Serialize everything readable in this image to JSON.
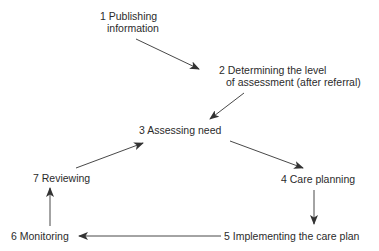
{
  "diagram": {
    "type": "cycle-flow",
    "nodes": [
      {
        "id": 1,
        "number": "1",
        "line1": "1 Publishing",
        "line2": "information"
      },
      {
        "id": 2,
        "number": "2",
        "line1": "2 Determining the level",
        "line2": "of assessment (after referral)"
      },
      {
        "id": 3,
        "number": "3",
        "line1": "3 Assessing need"
      },
      {
        "id": 4,
        "number": "4",
        "line1": "4 Care planning"
      },
      {
        "id": 5,
        "number": "5",
        "line1": "5 Implementing the care plan"
      },
      {
        "id": 6,
        "number": "6",
        "line1": "6 Monitoring"
      },
      {
        "id": 7,
        "number": "7",
        "line1": "7 Reviewing"
      }
    ],
    "edges": [
      {
        "from": 1,
        "to": 2
      },
      {
        "from": 2,
        "to": 3
      },
      {
        "from": 3,
        "to": 4
      },
      {
        "from": 4,
        "to": 5
      },
      {
        "from": 5,
        "to": 6
      },
      {
        "from": 6,
        "to": 7
      },
      {
        "from": 7,
        "to": 3
      }
    ],
    "colors": {
      "background": "#ffffff",
      "text": "#2b2b2b",
      "arrow": "#333333"
    }
  }
}
